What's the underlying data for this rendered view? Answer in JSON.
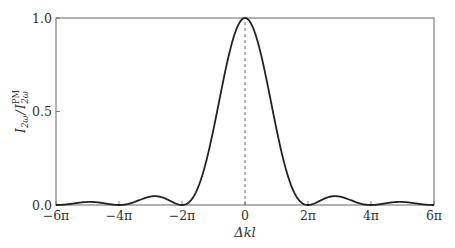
{
  "chart_data": {
    "type": "line",
    "title": "",
    "xlabel": "Δkl",
    "ylabel": "I_2ω / I_2ω^PM",
    "ylabel_parts": {
      "main": "I",
      "sub1": "2ω",
      "sep": "/",
      "main2": "I",
      "sup2": "PM",
      "sub2": "2ω"
    },
    "xlim": [
      -18.8496,
      18.8496
    ],
    "ylim": [
      0,
      1.0
    ],
    "x_ticks": [
      {
        "value": -18.8496,
        "label": "−6π"
      },
      {
        "value": -12.5664,
        "label": "−4π"
      },
      {
        "value": -6.2832,
        "label": "−2π"
      },
      {
        "value": 0,
        "label": "0"
      },
      {
        "value": 6.2832,
        "label": "2π"
      },
      {
        "value": 12.5664,
        "label": "4π"
      },
      {
        "value": 18.8496,
        "label": "6π"
      }
    ],
    "y_ticks": [
      {
        "value": 0.0,
        "label": "0.0"
      },
      {
        "value": 0.5,
        "label": "0.5"
      },
      {
        "value": 1.0,
        "label": "1.0"
      }
    ],
    "grid": false,
    "legend": "none",
    "series": [
      {
        "name": "sinc²(Δkl/2)",
        "function": "sinc^2(x/2)",
        "color": "#222222",
        "x": [
          -18.85,
          -15.7,
          -12.57,
          -9.0,
          -6.28,
          -4.0,
          -2.0,
          0,
          2.0,
          4.0,
          6.28,
          9.0,
          12.57,
          15.7,
          18.85
        ],
        "y": [
          0.0,
          0.016,
          0.0,
          0.047,
          0.0,
          0.207,
          0.708,
          1.0,
          0.708,
          0.207,
          0.0,
          0.047,
          0.0,
          0.016,
          0.0
        ]
      }
    ],
    "annotations": [
      {
        "type": "vertical-dashed-line",
        "x": 0,
        "y_from": 0,
        "y_to": 1.0
      }
    ]
  }
}
